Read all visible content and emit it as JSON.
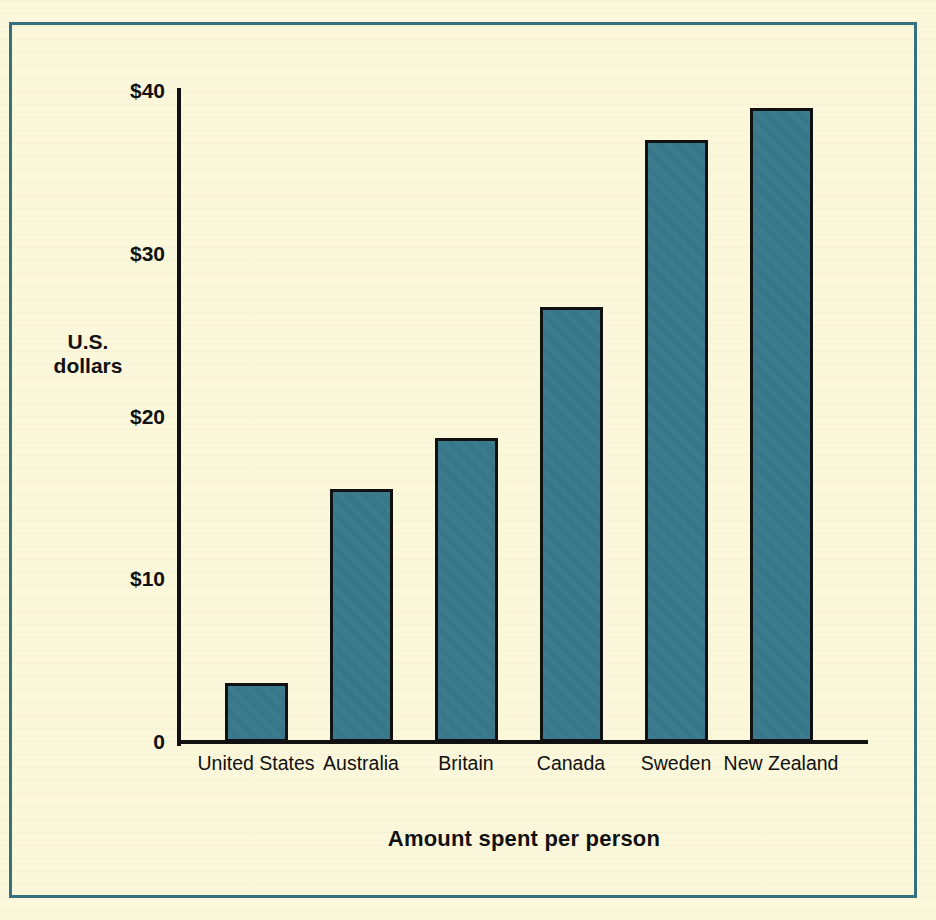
{
  "figure": {
    "frame_color": "#35707f",
    "background_color": "#fbf7da",
    "title_fragment": "per capita"
  },
  "axes": {
    "y_title_line1": "U.S.",
    "y_title_line2": "dollars",
    "x_title": "Amount spent per person",
    "y_ticks": [
      "$40",
      "$30",
      "$20",
      "$10",
      "0"
    ]
  },
  "chart_data": {
    "type": "bar",
    "title": "",
    "subtitle": "",
    "xlabel": "Amount spent per person",
    "ylabel": "U.S. dollars",
    "categories": [
      "United States",
      "Australia",
      "Britain",
      "Canada",
      "Sweden",
      "New Zealand"
    ],
    "values": [
      3.6,
      15.5,
      18.6,
      26.6,
      36.8,
      38.8
    ],
    "ylim": [
      0,
      40
    ],
    "ytick_values": [
      40,
      30,
      20,
      10,
      0
    ],
    "ytick_labels": [
      "$40",
      "$30",
      "$20",
      "$10",
      "0"
    ],
    "grid": false,
    "legend": false,
    "bar_color": "#35788a",
    "bar_edge_color": "#111111",
    "units": "U.S. dollars"
  }
}
